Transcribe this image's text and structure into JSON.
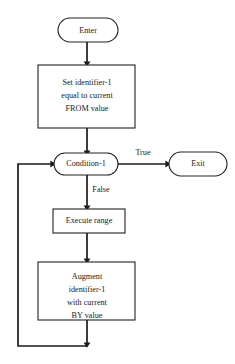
{
  "diagram": {
    "background_color": "#ffffff",
    "line_color": "#1a1a1a",
    "shape_fill": "#ffffff",
    "shape_stroke": "#222222"
  },
  "nodes": {
    "enter": {
      "label": "Enter",
      "shape": "terminator"
    },
    "set_identifier": {
      "shape": "process",
      "line1": "Set identifier-1",
      "line2": "equal to current",
      "line3": "FROM value"
    },
    "condition": {
      "label": "Condition-1",
      "shape": "decision-rounded"
    },
    "exit": {
      "label": "Exit",
      "shape": "terminator"
    },
    "execute_range": {
      "label": "Execute range",
      "shape": "process"
    },
    "augment": {
      "shape": "process",
      "line1": "Augment",
      "line2": "identifier-1",
      "line3": "with current",
      "line4": "BY value"
    }
  },
  "edges": {
    "true_label": "True",
    "false_label": "False"
  }
}
